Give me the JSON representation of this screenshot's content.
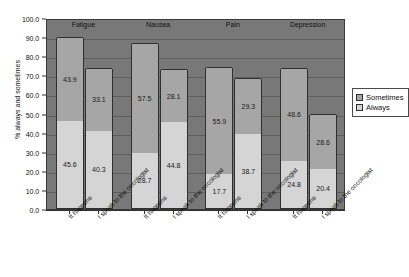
{
  "chart_data": {
    "type": "bar",
    "subtype": "stacked-bar-grouped",
    "title": "",
    "xlabel": "",
    "ylabel": "% always and sometimes",
    "ylim": [
      0.0,
      100.0
    ],
    "ytick_step": 10.0,
    "ytick_labels": [
      "100.0",
      "90.0",
      "80.0",
      "70.0",
      "60.0",
      "50.0",
      "40.0",
      "30.0",
      "20.0",
      "10.0",
      "0.0"
    ],
    "ytick_values": [
      100.0,
      90.0,
      80.0,
      70.0,
      60.0,
      50.0,
      40.0,
      30.0,
      20.0,
      10.0,
      0.0
    ],
    "grid": true,
    "grid_axis": "y",
    "legend_position": "right",
    "groups": [
      "Fatigue",
      "Nausea",
      "Pain",
      "Depression"
    ],
    "categories": [
      "It happens",
      "I speak to the oncologist",
      "It happens",
      "I speak to the oncologist",
      "It happens",
      "I speak to the oncologist",
      "It happens",
      "I speak to the oncologist"
    ],
    "series": [
      {
        "name": "Sometimes",
        "color": "#a6a6a6",
        "values": [
          43.9,
          33.1,
          57.5,
          28.1,
          55.9,
          29.3,
          48.6,
          28.6
        ]
      },
      {
        "name": "Always",
        "color": "#d5d5d5",
        "values": [
          45.6,
          40.3,
          28.7,
          44.8,
          17.7,
          38.7,
          24.8,
          20.4
        ]
      }
    ],
    "bars": [
      {
        "group": "Fatigue",
        "category": "It happens",
        "always": 45.6,
        "sometimes": 43.9,
        "total": 89.5
      },
      {
        "group": "Fatigue",
        "category": "I speak to the oncologist",
        "always": 40.3,
        "sometimes": 33.1,
        "total": 73.4
      },
      {
        "group": "Nausea",
        "category": "It happens",
        "always": 28.7,
        "sometimes": 57.5,
        "total": 86.2
      },
      {
        "group": "Nausea",
        "category": "I speak to the oncologist",
        "always": 44.8,
        "sometimes": 28.1,
        "total": 72.9
      },
      {
        "group": "Pain",
        "category": "It happens",
        "always": 17.7,
        "sometimes": 55.9,
        "total": 73.6
      },
      {
        "group": "Pain",
        "category": "I speak to the oncologist",
        "always": 38.7,
        "sometimes": 29.3,
        "total": 68.0
      },
      {
        "group": "Depression",
        "category": "It happens",
        "always": 24.8,
        "sometimes": 48.6,
        "total": 73.4
      },
      {
        "group": "Depression",
        "category": "I speak to the oncologist",
        "always": 20.4,
        "sometimes": 28.6,
        "total": 49.0
      }
    ],
    "legend": [
      {
        "label": "Sometimes",
        "color": "#a6a6a6"
      },
      {
        "label": "Always",
        "color": "#d5d5d5"
      }
    ],
    "colors": {
      "plot_background": "#787878",
      "gridline": "#5e5e5e",
      "axis": "#2e2e2e",
      "sometimes": "#a6a6a6",
      "always": "#d5d5d5",
      "page_background": "#ffffff",
      "text": "#111111"
    }
  }
}
